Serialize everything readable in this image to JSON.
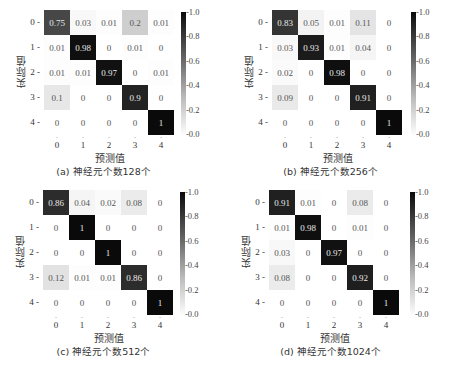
{
  "chart_data": [
    {
      "type": "heatmap",
      "title": "(a) 神经元个数128个",
      "xlabel": "预测值",
      "ylabel": "实际值",
      "x_ticks": [
        "0",
        "1",
        "2",
        "3",
        "4"
      ],
      "y_ticks": [
        "0",
        "1",
        "2",
        "3",
        "4"
      ],
      "colorbar": {
        "range": [
          0.0,
          1.0
        ],
        "ticks": [
          "1.0",
          "0.8",
          "0.6",
          "0.4",
          "0.2",
          "0.0"
        ],
        "colormap": "white-to-black"
      },
      "matrix": [
        [
          0.75,
          0.03,
          0.01,
          0.2,
          0.01
        ],
        [
          0.01,
          0.98,
          0,
          0.01,
          0
        ],
        [
          0.01,
          0.01,
          0.97,
          0,
          0.01
        ],
        [
          0.1,
          0,
          0,
          0.9,
          0
        ],
        [
          0,
          0,
          0,
          0,
          1
        ]
      ]
    },
    {
      "type": "heatmap",
      "title": "(b) 神经元个数256个",
      "xlabel": "预测值",
      "ylabel": "实际值",
      "x_ticks": [
        "0",
        "1",
        "2",
        "3",
        "4"
      ],
      "y_ticks": [
        "0",
        "1",
        "2",
        "3",
        "4"
      ],
      "colorbar": {
        "range": [
          0.0,
          1.0
        ],
        "ticks": [
          "1.0",
          "0.8",
          "0.6",
          "0.4",
          "0.2",
          "0.0"
        ],
        "colormap": "white-to-black"
      },
      "matrix": [
        [
          0.83,
          0.05,
          0.01,
          0.11,
          0
        ],
        [
          0.03,
          0.93,
          0.01,
          0.04,
          0
        ],
        [
          0.02,
          0,
          0.98,
          0,
          0
        ],
        [
          0.09,
          0,
          0,
          0.91,
          0
        ],
        [
          0,
          0,
          0,
          0,
          1
        ]
      ]
    },
    {
      "type": "heatmap",
      "title": "(c) 神经元个数512个",
      "xlabel": "预测值",
      "ylabel": "实际值",
      "x_ticks": [
        "0",
        "1",
        "2",
        "3",
        "4"
      ],
      "y_ticks": [
        "0",
        "1",
        "2",
        "3",
        "4"
      ],
      "colorbar": {
        "range": [
          0.0,
          1.0
        ],
        "ticks": [
          "1.0",
          "0.8",
          "0.6",
          "0.4",
          "0.2",
          "0.0"
        ],
        "colormap": "white-to-black"
      },
      "matrix": [
        [
          0.86,
          0.04,
          0.02,
          0.08,
          0
        ],
        [
          0,
          1,
          0,
          0,
          0
        ],
        [
          0,
          0,
          1,
          0,
          0
        ],
        [
          0.12,
          0.01,
          0.01,
          0.86,
          0
        ],
        [
          0,
          0,
          0,
          0,
          1
        ]
      ]
    },
    {
      "type": "heatmap",
      "title": "(d) 神经元个数1024个",
      "xlabel": "预测值",
      "ylabel": "实际值",
      "x_ticks": [
        "0",
        "1",
        "2",
        "3",
        "4"
      ],
      "y_ticks": [
        "0",
        "1",
        "2",
        "3",
        "4"
      ],
      "colorbar": {
        "range": [
          0.0,
          1.0
        ],
        "ticks": [
          "1.0",
          "0.8",
          "0.6",
          "0.4",
          "0.2",
          "0.0"
        ],
        "colormap": "white-to-black"
      },
      "matrix": [
        [
          0.91,
          0.01,
          0,
          0.08,
          0
        ],
        [
          0.01,
          0.98,
          0,
          0.01,
          0
        ],
        [
          0.03,
          0,
          0.97,
          0,
          0
        ],
        [
          0.08,
          0,
          0,
          0.92,
          0
        ],
        [
          0,
          0,
          0,
          0,
          1
        ]
      ]
    }
  ],
  "layout": {
    "panels": [
      {
        "left": 0,
        "top": 0,
        "grid_x": 44,
        "grid_y": 10,
        "cbar_x": 181
      },
      {
        "left": 227,
        "top": 0,
        "grid_x": 45,
        "grid_y": 10,
        "cbar_x": 184
      },
      {
        "left": 0,
        "top": 186,
        "grid_x": 43,
        "grid_y": 4,
        "cbar_x": 180
      },
      {
        "left": 227,
        "top": 186,
        "grid_x": 42,
        "grid_y": 4,
        "cbar_x": 183
      }
    ]
  }
}
